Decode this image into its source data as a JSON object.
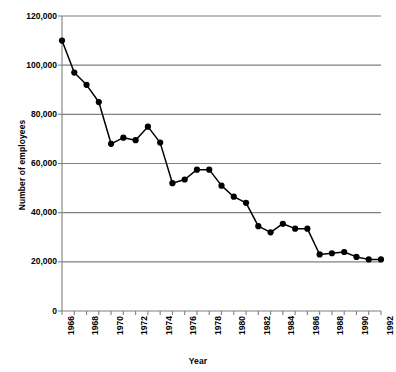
{
  "chart_data": {
    "type": "line",
    "title": "",
    "xlabel": "Year",
    "ylabel": "Number of employees",
    "xlim": [
      1966,
      1992
    ],
    "ylim": [
      0,
      120000
    ],
    "grid": true,
    "legend": false,
    "marker": "filled-circle",
    "y_ticks": [
      0,
      20000,
      40000,
      60000,
      80000,
      100000,
      120000
    ],
    "y_tick_labels": [
      "0",
      "20,000",
      "40,000",
      "60,000",
      "80,000",
      "100,000",
      "120,000"
    ],
    "x_ticks": [
      1966,
      1967,
      1968,
      1969,
      1970,
      1971,
      1972,
      1973,
      1974,
      1975,
      1976,
      1977,
      1978,
      1979,
      1980,
      1981,
      1982,
      1983,
      1984,
      1985,
      1986,
      1987,
      1988,
      1989,
      1990,
      1991,
      1992
    ],
    "x_tick_labels": [
      "1966",
      "",
      "1968",
      "",
      "1970",
      "",
      "1972",
      "",
      "1974",
      "",
      "1976",
      "",
      "1978",
      "",
      "1980",
      "",
      "1982",
      "",
      "1984",
      "",
      "1986",
      "",
      "1988",
      "",
      "1990",
      "",
      "1992"
    ],
    "x": [
      1966,
      1967,
      1968,
      1969,
      1970,
      1971,
      1972,
      1973,
      1974,
      1975,
      1976,
      1977,
      1978,
      1979,
      1980,
      1981,
      1982,
      1983,
      1984,
      1985,
      1986,
      1987,
      1988,
      1989,
      1990,
      1991,
      1992
    ],
    "values": [
      110000,
      97000,
      92000,
      85000,
      68000,
      70500,
      69500,
      75000,
      68500,
      52000,
      53500,
      57500,
      57500,
      51000,
      46500,
      44000,
      34500,
      32000,
      35500,
      33500,
      33500,
      23000,
      23500,
      24000,
      22000,
      21000,
      21000
    ],
    "series": [
      {
        "name": "Number of employees",
        "values": [
          110000,
          97000,
          92000,
          85000,
          68000,
          70500,
          69500,
          75000,
          68500,
          52000,
          53500,
          57500,
          57500,
          51000,
          46500,
          44000,
          34500,
          32000,
          35500,
          33500,
          33500,
          23000,
          23500,
          24000,
          22000,
          21000,
          21000
        ]
      }
    ],
    "colors": {
      "line": "#000000",
      "marker": "#000000",
      "grid": "#808080",
      "axis": "#808080",
      "background": "#ffffff"
    }
  }
}
